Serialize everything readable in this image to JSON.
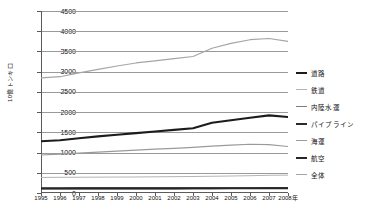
{
  "chart_data": {
    "type": "line",
    "title": "",
    "xlabel": "",
    "ylabel": "10億トンキロ",
    "x": [
      "1995",
      "1996",
      "1997",
      "1998",
      "1999",
      "2000",
      "2001",
      "2002",
      "2003",
      "2004",
      "2005",
      "2006",
      "2007",
      "2008"
    ],
    "xlim": [
      1995,
      2008
    ],
    "ylim": [
      0,
      4500
    ],
    "ytick_labels": [
      "0",
      "500",
      "1000",
      "1500",
      "2000",
      "2500",
      "3000",
      "3500",
      "4000",
      "4500"
    ],
    "ytick_values": [
      0,
      500,
      1000,
      1500,
      2000,
      2500,
      3000,
      3500,
      4000,
      4500
    ],
    "grid": true,
    "legend_position": "right",
    "x_axis_suffix": "年",
    "series": [
      {
        "name": "道路",
        "color": "#1c1c1c",
        "width": 2.1,
        "values": [
          1280,
          1305,
          1355,
          1400,
          1440,
          1480,
          1520,
          1560,
          1600,
          1735,
          1800,
          1860,
          1920,
          1880
        ]
      },
      {
        "name": "鉄道",
        "color": "#b4b4b4",
        "width": 1.0,
        "values": [
          385,
          388,
          390,
          392,
          394,
          396,
          400,
          404,
          408,
          414,
          420,
          428,
          438,
          442
        ]
      },
      {
        "name": "内陸水運",
        "color": "#7d7d7d",
        "width": 1.0,
        "values": [
          118,
          118,
          119,
          119,
          120,
          120,
          121,
          121,
          122,
          122,
          123,
          124,
          125,
          125
        ]
      },
      {
        "name": "パイプライン",
        "color": "#2b2b2b",
        "width": 1.9,
        "values": [
          115,
          115,
          116,
          116,
          117,
          117,
          118,
          118,
          119,
          119,
          120,
          120,
          121,
          121
        ]
      },
      {
        "name": "海運",
        "color": "#9a9a9a",
        "width": 1.2,
        "values": [
          940,
          960,
          985,
          1010,
          1035,
          1060,
          1085,
          1105,
          1130,
          1160,
          1185,
          1205,
          1195,
          1150
        ]
      },
      {
        "name": "航空",
        "color": "#262626",
        "width": 1.9,
        "values": [
          110,
          110,
          111,
          111,
          112,
          112,
          113,
          113,
          114,
          114,
          115,
          115,
          116,
          116
        ]
      },
      {
        "name": "全体",
        "color": "#a5a5a5",
        "width": 1.2,
        "values": [
          2845,
          2875,
          2970,
          3055,
          3140,
          3215,
          3265,
          3320,
          3375,
          3580,
          3700,
          3790,
          3820,
          3750
        ]
      }
    ]
  },
  "legend": {
    "items": [
      {
        "label": "道路",
        "color": "#1c1c1c",
        "thickness": 2.4
      },
      {
        "label": "鉄道",
        "color": "#b4b4b4",
        "thickness": 1.2
      },
      {
        "label": "内陸水運",
        "color": "#7d7d7d",
        "thickness": 1.4
      },
      {
        "label": "パイプライン",
        "color": "#2b2b2b",
        "thickness": 2.2
      },
      {
        "label": "海運",
        "color": "#9a9a9a",
        "thickness": 1.4
      },
      {
        "label": "航空",
        "color": "#262626",
        "thickness": 2.2
      },
      {
        "label": "全体",
        "color": "#a5a5a5",
        "thickness": 1.4
      }
    ]
  }
}
